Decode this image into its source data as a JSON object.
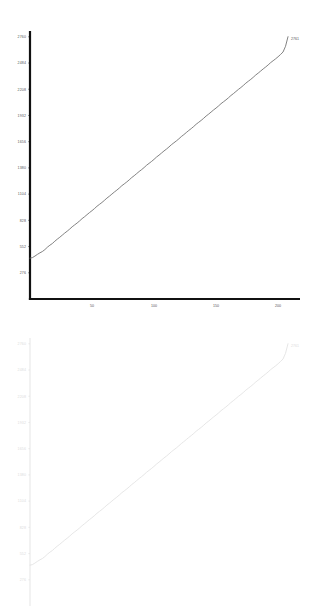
{
  "chart_data": [
    {
      "id": "top",
      "type": "line",
      "title": "",
      "xlabel": "",
      "ylabel": "",
      "xlim": [
        0,
        208
      ],
      "ylim": [
        0,
        2800
      ],
      "grid": false,
      "legend": null,
      "axis_color": "#111111",
      "line_color": "#6b6b6b",
      "tick_text_color": "#555555",
      "yticks": [
        276,
        552,
        828,
        1104,
        1380,
        1656,
        1932,
        2208,
        2484,
        2760
      ],
      "ytick_labels": [
        "276",
        "552",
        "828",
        "1104",
        "1380",
        "1656",
        "1932",
        "2208",
        "2484",
        "2760"
      ],
      "xticks": [
        50,
        100,
        150,
        200
      ],
      "xtick_labels": [
        "50",
        "100",
        "150",
        "200"
      ],
      "end_label": "2761",
      "series": [
        {
          "name": "cumulative",
          "x": [
            0,
            2,
            4,
            6,
            8,
            10,
            12,
            14,
            16,
            18,
            20,
            22,
            24,
            26,
            28,
            30,
            32,
            34,
            36,
            38,
            40,
            42,
            44,
            46,
            48,
            50,
            52,
            54,
            56,
            58,
            60,
            62,
            64,
            66,
            68,
            70,
            72,
            74,
            76,
            78,
            80,
            82,
            84,
            86,
            88,
            90,
            92,
            94,
            96,
            98,
            100,
            102,
            104,
            106,
            108,
            110,
            112,
            114,
            116,
            118,
            120,
            122,
            124,
            126,
            128,
            130,
            132,
            134,
            136,
            138,
            140,
            142,
            144,
            146,
            148,
            150,
            152,
            154,
            156,
            158,
            160,
            162,
            164,
            166,
            168,
            170,
            172,
            174,
            176,
            178,
            180,
            182,
            184,
            186,
            188,
            190,
            192,
            194,
            196,
            198,
            200,
            202,
            204,
            206,
            208
          ],
          "values": [
            430,
            436,
            452,
            470,
            486,
            500,
            520,
            545,
            566,
            584,
            608,
            630,
            650,
            672,
            694,
            714,
            736,
            760,
            780,
            800,
            822,
            846,
            866,
            888,
            910,
            930,
            952,
            976,
            996,
            1016,
            1038,
            1062,
            1082,
            1104,
            1126,
            1146,
            1168,
            1192,
            1212,
            1232,
            1254,
            1278,
            1298,
            1320,
            1342,
            1362,
            1384,
            1408,
            1428,
            1448,
            1470,
            1494,
            1514,
            1536,
            1558,
            1578,
            1600,
            1624,
            1644,
            1664,
            1686,
            1710,
            1730,
            1752,
            1774,
            1794,
            1816,
            1840,
            1860,
            1880,
            1902,
            1926,
            1946,
            1968,
            1990,
            2010,
            2032,
            2056,
            2076,
            2096,
            2118,
            2142,
            2162,
            2184,
            2206,
            2226,
            2248,
            2272,
            2292,
            2312,
            2334,
            2358,
            2378,
            2400,
            2422,
            2442,
            2464,
            2488,
            2508,
            2528,
            2550,
            2574,
            2600,
            2660,
            2761
          ]
        }
      ]
    },
    {
      "id": "bottom",
      "type": "line",
      "title": "",
      "xlabel": "",
      "ylabel": "",
      "xlim": [
        0,
        208
      ],
      "ylim": [
        0,
        2800
      ],
      "grid": false,
      "legend": null,
      "axis_color": "#e2e2e2",
      "line_color": "#e0e0e0",
      "tick_text_color": "#dcdcdc",
      "yticks": [
        276,
        552,
        828,
        1104,
        1380,
        1656,
        1932,
        2208,
        2484,
        2760
      ],
      "ytick_labels": [
        "276",
        "552",
        "828",
        "1104",
        "1380",
        "1656",
        "1932",
        "2208",
        "2484",
        "2760"
      ],
      "xticks": [],
      "xtick_labels": [],
      "end_label": "2761",
      "series": [
        {
          "name": "cumulative",
          "x": [
            0,
            2,
            4,
            6,
            8,
            10,
            12,
            14,
            16,
            18,
            20,
            22,
            24,
            26,
            28,
            30,
            32,
            34,
            36,
            38,
            40,
            42,
            44,
            46,
            48,
            50,
            52,
            54,
            56,
            58,
            60,
            62,
            64,
            66,
            68,
            70,
            72,
            74,
            76,
            78,
            80,
            82,
            84,
            86,
            88,
            90,
            92,
            94,
            96,
            98,
            100,
            102,
            104,
            106,
            108,
            110,
            112,
            114,
            116,
            118,
            120,
            122,
            124,
            126,
            128,
            130,
            132,
            134,
            136,
            138,
            140,
            142,
            144,
            146,
            148,
            150,
            152,
            154,
            156,
            158,
            160,
            162,
            164,
            166,
            168,
            170,
            172,
            174,
            176,
            178,
            180,
            182,
            184,
            186,
            188,
            190,
            192,
            194,
            196,
            198,
            200,
            202,
            204,
            206,
            208
          ],
          "values": [
            430,
            436,
            452,
            470,
            486,
            500,
            520,
            545,
            566,
            584,
            608,
            630,
            650,
            672,
            694,
            714,
            736,
            760,
            780,
            800,
            822,
            846,
            866,
            888,
            910,
            930,
            952,
            976,
            996,
            1016,
            1038,
            1062,
            1082,
            1104,
            1126,
            1146,
            1168,
            1192,
            1212,
            1232,
            1254,
            1278,
            1298,
            1320,
            1342,
            1362,
            1384,
            1408,
            1428,
            1448,
            1470,
            1494,
            1514,
            1536,
            1558,
            1578,
            1600,
            1624,
            1644,
            1664,
            1686,
            1710,
            1730,
            1752,
            1774,
            1794,
            1816,
            1840,
            1860,
            1880,
            1902,
            1926,
            1946,
            1968,
            1990,
            2010,
            2032,
            2056,
            2076,
            2096,
            2118,
            2142,
            2162,
            2184,
            2206,
            2226,
            2248,
            2272,
            2292,
            2312,
            2334,
            2358,
            2378,
            2400,
            2422,
            2442,
            2464,
            2488,
            2508,
            2528,
            2550,
            2574,
            2600,
            2660,
            2761
          ]
        }
      ]
    }
  ]
}
